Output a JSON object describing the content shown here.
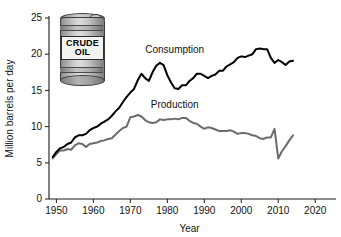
{
  "chart_data": {
    "type": "line",
    "title": "",
    "xlabel": "Year",
    "ylabel": "Million barrels per day",
    "xlim": [
      1948,
      2024
    ],
    "ylim": [
      0,
      25
    ],
    "xticks": [
      1950,
      1960,
      1970,
      1980,
      1990,
      2000,
      2010,
      2020
    ],
    "yticks": [
      0,
      5,
      10,
      15,
      20,
      25
    ],
    "grid": false,
    "legend_position": "inline-annotations",
    "series": [
      {
        "name": "Consumption",
        "color": "#000000",
        "x": [
          1949,
          1950,
          1951,
          1952,
          1953,
          1954,
          1955,
          1956,
          1957,
          1958,
          1959,
          1960,
          1961,
          1962,
          1963,
          1964,
          1965,
          1966,
          1967,
          1968,
          1969,
          1970,
          1971,
          1972,
          1973,
          1974,
          1975,
          1976,
          1977,
          1978,
          1979,
          1980,
          1981,
          1982,
          1983,
          1984,
          1985,
          1986,
          1987,
          1988,
          1989,
          1990,
          1991,
          1992,
          1993,
          1994,
          1995,
          1996,
          1997,
          1998,
          1999,
          2000,
          2001,
          2002,
          2003,
          2004,
          2005,
          2006,
          2007,
          2008,
          2009,
          2010,
          2011,
          2012,
          2013,
          2014
        ],
        "values": [
          5.8,
          6.5,
          7.0,
          7.2,
          7.6,
          7.8,
          8.5,
          8.8,
          8.8,
          9.0,
          9.5,
          9.8,
          10.0,
          10.4,
          10.7,
          11.0,
          11.5,
          12.1,
          12.6,
          13.4,
          14.1,
          14.7,
          15.2,
          16.4,
          17.3,
          16.7,
          16.3,
          17.5,
          18.4,
          18.8,
          18.5,
          17.1,
          16.1,
          15.3,
          15.2,
          15.7,
          15.7,
          16.3,
          16.7,
          17.3,
          17.3,
          17.0,
          16.7,
          17.0,
          17.2,
          17.7,
          17.7,
          18.3,
          18.6,
          18.9,
          19.5,
          19.7,
          19.6,
          19.8,
          20.0,
          20.7,
          20.8,
          20.7,
          20.7,
          19.5,
          18.8,
          19.2,
          18.9,
          18.5,
          19.0,
          19.1
        ]
      },
      {
        "name": "Production",
        "color": "#6b6b6b",
        "x": [
          1949,
          1950,
          1951,
          1952,
          1953,
          1954,
          1955,
          1956,
          1957,
          1958,
          1959,
          1960,
          1961,
          1962,
          1963,
          1964,
          1965,
          1966,
          1967,
          1968,
          1969,
          1970,
          1971,
          1972,
          1973,
          1974,
          1975,
          1976,
          1977,
          1978,
          1979,
          1980,
          1981,
          1982,
          1983,
          1984,
          1985,
          1986,
          1987,
          1988,
          1989,
          1990,
          1991,
          1992,
          1993,
          1994,
          1995,
          1996,
          1997,
          1998,
          1999,
          2000,
          2001,
          2002,
          2003,
          2004,
          2005,
          2006,
          2007,
          2008,
          2009,
          2010,
          2011,
          2012,
          2013,
          2014
        ],
        "values": [
          5.6,
          6.2,
          6.7,
          6.7,
          6.9,
          6.8,
          7.4,
          7.7,
          7.6,
          7.2,
          7.6,
          7.7,
          7.8,
          8.0,
          8.1,
          8.3,
          8.4,
          8.9,
          9.4,
          9.8,
          10.0,
          11.3,
          11.4,
          11.6,
          11.4,
          10.9,
          10.6,
          10.5,
          10.6,
          11.0,
          10.9,
          11.0,
          11.0,
          11.1,
          11.0,
          11.2,
          11.2,
          10.8,
          10.5,
          10.4,
          10.0,
          9.7,
          9.9,
          9.8,
          9.6,
          9.4,
          9.4,
          9.4,
          9.5,
          9.3,
          9.0,
          9.1,
          9.1,
          9.0,
          8.8,
          8.7,
          8.4,
          8.3,
          8.5,
          8.5,
          9.7,
          5.6,
          6.6,
          7.3,
          8.1,
          8.8
        ]
      }
    ],
    "annotations": [
      {
        "text": "Consumption",
        "x": 1982,
        "y": 20.2
      },
      {
        "text": "Production",
        "x": 1982,
        "y": 12.6
      }
    ]
  },
  "illustration": {
    "name": "crude-oil-barrel",
    "label_line1": "CRUDE",
    "label_line2": "OIL"
  }
}
